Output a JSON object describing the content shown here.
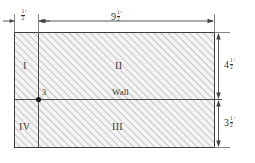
{
  "figure": {
    "background_color": "#ffffff",
    "outline_color": "#3c3c3c",
    "hatch_color": "#b9b9b9",
    "fill_color": "#f2f2f2",
    "dimension_color": "#444444"
  },
  "regions": [
    {
      "id": "I",
      "label": "I"
    },
    {
      "id": "II",
      "label": "II"
    },
    {
      "id": "III",
      "label": "III"
    },
    {
      "id": "IV",
      "label": "IV"
    }
  ],
  "annotations": {
    "wall_label": "Wall",
    "node_label": "3"
  },
  "dimensions": [
    {
      "name": "left-strip-width",
      "whole": "",
      "numerator": "1",
      "denominator": "2",
      "unit": "′",
      "value": 0.5,
      "orientation": "horizontal",
      "position": "top-left"
    },
    {
      "name": "main-width",
      "whole": "9",
      "numerator": "1",
      "denominator": "2",
      "unit": "′",
      "value": 9.5,
      "orientation": "horizontal",
      "position": "top"
    },
    {
      "name": "upper-height",
      "whole": "4",
      "numerator": "1",
      "denominator": "2",
      "unit": "′",
      "value": 4.5,
      "orientation": "vertical",
      "position": "right-upper"
    },
    {
      "name": "lower-height",
      "whole": "3",
      "numerator": "1",
      "denominator": "2",
      "unit": "′",
      "value": 3.5,
      "orientation": "vertical",
      "position": "right-lower"
    }
  ]
}
